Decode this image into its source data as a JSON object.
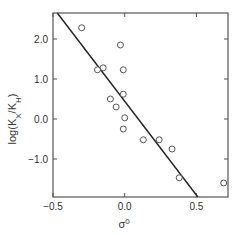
{
  "chart_data": {
    "type": "scatter",
    "title": "",
    "xlabel": "σ⁰",
    "ylabel": "log(K_X/K_H)",
    "xlim": [
      -0.5,
      0.72
    ],
    "ylim": [
      -1.95,
      2.65
    ],
    "grid": false,
    "legend": null,
    "x_ticks": [
      -0.5,
      0.0,
      0.5
    ],
    "x_tick_labels": [
      "−0.5",
      "0.0",
      "0.5"
    ],
    "y_ticks": [
      2.0,
      1.0,
      0.0,
      -1.0
    ],
    "y_tick_labels": [
      "2.0",
      "1.0",
      "0.0",
      "−1.0"
    ],
    "series": [
      {
        "name": "data",
        "marker": "open-circle",
        "points": [
          {
            "x": -0.3,
            "y": 2.28
          },
          {
            "x": -0.03,
            "y": 1.85
          },
          {
            "x": -0.19,
            "y": 1.23
          },
          {
            "x": -0.15,
            "y": 1.28
          },
          {
            "x": -0.01,
            "y": 1.23
          },
          {
            "x": -0.01,
            "y": 0.62
          },
          {
            "x": -0.1,
            "y": 0.5
          },
          {
            "x": -0.06,
            "y": 0.3
          },
          {
            "x": 0.0,
            "y": 0.03
          },
          {
            "x": -0.01,
            "y": -0.25
          },
          {
            "x": 0.13,
            "y": -0.52
          },
          {
            "x": 0.24,
            "y": -0.52
          },
          {
            "x": 0.33,
            "y": -0.75
          },
          {
            "x": 0.38,
            "y": -1.47
          },
          {
            "x": 0.69,
            "y": -1.6
          }
        ]
      }
    ],
    "fit_line": {
      "x1": -0.47,
      "y1": 2.65,
      "x2": 0.51,
      "y2": -1.95,
      "slope": -4.7
    }
  },
  "colors": {
    "axis": "#555555",
    "line": "#222222",
    "marker": "#444444"
  }
}
